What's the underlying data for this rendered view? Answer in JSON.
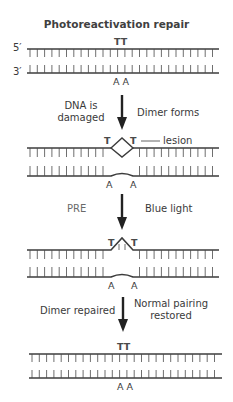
{
  "title": "Photoreactivation repair",
  "strand_labels": {
    "five_prime": "5′",
    "three_prime": "3′"
  },
  "stages": [
    {
      "id": "normal",
      "top_bases": "TT",
      "bottom_bases": "A A"
    },
    {
      "id": "damaged",
      "top_left": "T",
      "top_right": "T",
      "lesion_label": "lesion",
      "bottom_left": "A",
      "bottom_right": "A"
    },
    {
      "id": "pre-bound",
      "top_left": "T",
      "top_right": "T",
      "bottom_left": "A",
      "bottom_right": "A"
    },
    {
      "id": "repaired",
      "top_bases": "TT",
      "bottom_bases": "A A"
    }
  ],
  "steps": [
    {
      "left": "DNA is damaged",
      "left_line1": "DNA is",
      "left_line2": "damaged",
      "right": "Dimer forms"
    },
    {
      "left": "PRE",
      "right": "Blue light"
    },
    {
      "left": "Dimer repaired",
      "right": "Normal pairing restored",
      "right_line1": "Normal pairing",
      "right_line2": "restored"
    }
  ],
  "colors": {
    "strand": "#3c3c3c",
    "arrow": "#222222",
    "text": "#3a3a3a",
    "muted_text": "#6a6a6a"
  }
}
